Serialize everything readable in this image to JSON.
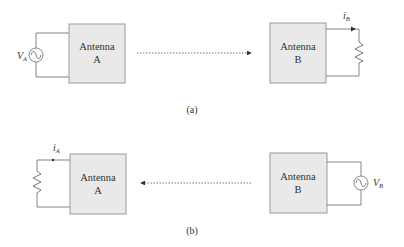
{
  "diagram": {
    "colors": {
      "box_fill": "#e9e9e9",
      "box_stroke": "#9a9a9a",
      "wire": "#777777",
      "text": "#333333"
    },
    "panel_a": {
      "caption": "(a)",
      "antenna_left": {
        "line1": "Antenna",
        "line2": "A"
      },
      "antenna_right": {
        "line1": "Antenna",
        "line2": "B"
      },
      "source_label": {
        "main": "V",
        "sub": "A"
      },
      "current_label": {
        "main": "i",
        "sub": "B"
      },
      "arrow_direction": "left-to-right"
    },
    "panel_b": {
      "caption": "(b)",
      "antenna_left": {
        "line1": "Antenna",
        "line2": "A"
      },
      "antenna_right": {
        "line1": "Antenna",
        "line2": "B"
      },
      "source_label": {
        "main": "V",
        "sub": "B"
      },
      "current_label": {
        "main": "i",
        "sub": "A"
      },
      "arrow_direction": "right-to-left"
    }
  }
}
